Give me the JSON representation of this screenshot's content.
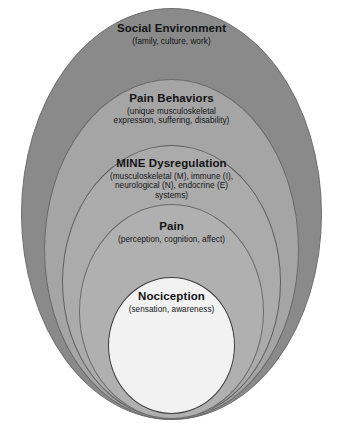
{
  "diagram": {
    "type": "nested-ellipse-model",
    "layers": [
      {
        "id": "social-environment",
        "order": 1,
        "position": "outermost",
        "title": "Social Environment",
        "subtitle": "(family, culture, work)",
        "fill": "#8a8a8a",
        "stroke": "#6e6e6e"
      },
      {
        "id": "pain-behaviors",
        "order": 2,
        "title": "Pain Behaviors",
        "subtitle_line_1": "(unique musculoskeletal",
        "subtitle_line_2": "expression, suffering, disability)",
        "fill": "#a5a5a5",
        "stroke": "#6a6a6a"
      },
      {
        "id": "mine-dysregulation",
        "order": 3,
        "title": "MINE Dysregulation",
        "subtitle_line_1": "(musculoskeletal (M), immune (I),",
        "subtitle_line_2": "neurological (N), endocrine (E)",
        "subtitle_line_3": "systems)",
        "fill": "#ababab",
        "stroke": "#5f5f5f"
      },
      {
        "id": "pain",
        "order": 4,
        "title": "Pain",
        "subtitle": "(perception, cognition, affect)",
        "fill": "#b0b0b0",
        "stroke": "#6b6b6b"
      },
      {
        "id": "nociception",
        "order": 5,
        "position": "innermost",
        "title": "Nociception",
        "subtitle": "(sensation, awareness)",
        "fill": "#f2f2f2",
        "stroke": "#3d3d3d"
      }
    ],
    "background": "#ffffff",
    "text_color": "#141414"
  }
}
